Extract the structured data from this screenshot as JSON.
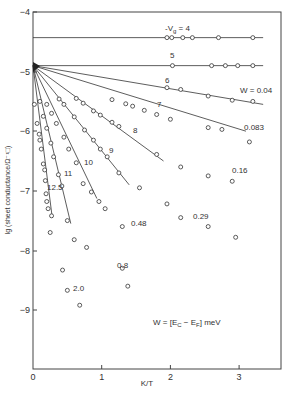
{
  "chart_data": {
    "type": "line",
    "title": "",
    "xlabel": "K/T",
    "ylabel": "lg (sheet conductance/Ω⁻¹□)",
    "xlim": [
      0,
      3.6
    ],
    "ylim": [
      -10,
      -4
    ],
    "x_ticks": [
      "0",
      "1",
      "2",
      "3"
    ],
    "y_ticks": [
      "-4",
      "-5",
      "-6",
      "-7",
      "-8",
      "-9"
    ],
    "grid": false,
    "annotation": "W = [E_C − E_F] meV",
    "origin_point": [
      0,
      -4.9
    ],
    "series": [
      {
        "name": "-Vg = 4",
        "label": "-V_g = 4",
        "w_label": "",
        "line": [
          [
            0,
            -4.43
          ],
          [
            3.35,
            -4.43
          ]
        ],
        "points": [
          [
            1.95,
            -4.43
          ],
          [
            2.02,
            -4.43
          ],
          [
            2.18,
            -4.43
          ],
          [
            2.32,
            -4.43
          ],
          [
            2.7,
            -4.43
          ],
          [
            3.2,
            -4.43
          ]
        ]
      },
      {
        "name": "-Vg = 5",
        "label": "5",
        "w_label": "",
        "line": [
          [
            0,
            -4.9
          ],
          [
            3.35,
            -4.9
          ]
        ],
        "points": [
          [
            2.03,
            -4.9
          ],
          [
            2.6,
            -4.9
          ],
          [
            2.8,
            -4.9
          ],
          [
            2.98,
            -4.9
          ],
          [
            3.2,
            -4.9
          ]
        ]
      },
      {
        "name": "-Vg = 6",
        "label": "6",
        "w_label": "W = 0.04",
        "line": [
          [
            0,
            -4.9
          ],
          [
            3.35,
            -5.55
          ]
        ],
        "points": [
          [
            1.95,
            -5.27
          ],
          [
            2.15,
            -5.3
          ],
          [
            2.55,
            -5.41
          ],
          [
            2.9,
            -5.48
          ],
          [
            3.2,
            -5.5
          ]
        ]
      },
      {
        "name": "-Vg = 7",
        "label": "7",
        "w_label": "0.083",
        "line": [
          [
            0,
            -4.9
          ],
          [
            3.1,
            -6.0
          ]
        ],
        "points": [
          [
            1.15,
            -5.47
          ],
          [
            1.35,
            -5.54
          ],
          [
            1.45,
            -5.58
          ],
          [
            1.62,
            -5.65
          ],
          [
            1.8,
            -5.72
          ],
          [
            2.0,
            -5.8
          ],
          [
            2.55,
            -5.94
          ],
          [
            2.75,
            -5.97
          ]
        ],
        "extra_points": [
          [
            3.15,
            -6.18
          ]
        ]
      },
      {
        "name": "-Vg = 8",
        "label": "8",
        "w_label": "0.16",
        "line": [
          [
            0,
            -4.9
          ],
          [
            1.9,
            -6.5
          ]
        ],
        "points": [
          [
            0.63,
            -5.45
          ],
          [
            0.73,
            -5.53
          ],
          [
            0.88,
            -5.66
          ],
          [
            0.98,
            -5.73
          ],
          [
            1.15,
            -5.85
          ],
          [
            1.25,
            -5.92
          ],
          [
            1.8,
            -6.39
          ]
        ],
        "extra_points": [
          [
            2.15,
            -6.6
          ],
          [
            2.55,
            -6.75
          ],
          [
            2.9,
            -6.84
          ]
        ]
      },
      {
        "name": "-Vg = 9",
        "label": "9",
        "w_label": "0.29",
        "line": [
          [
            0,
            -4.9
          ],
          [
            1.4,
            -6.9
          ]
        ],
        "points": [
          [
            0.38,
            -5.46
          ],
          [
            0.45,
            -5.55
          ],
          [
            0.6,
            -5.76
          ],
          [
            0.75,
            -5.98
          ],
          [
            0.88,
            -6.15
          ],
          [
            0.98,
            -6.3
          ],
          [
            1.08,
            -6.43
          ],
          [
            1.25,
            -6.7
          ]
        ],
        "extra_points": [
          [
            1.55,
            -6.95
          ],
          [
            1.95,
            -7.22
          ],
          [
            2.15,
            -7.45
          ],
          [
            2.55,
            -7.6
          ],
          [
            2.95,
            -7.78
          ]
        ]
      },
      {
        "name": "-Vg = 10",
        "label": "10",
        "w_label": "0.48",
        "line": [
          [
            0,
            -4.9
          ],
          [
            0.93,
            -7.13
          ]
        ],
        "points": [
          [
            0.2,
            -5.55
          ],
          [
            0.27,
            -5.7
          ],
          [
            0.34,
            -5.87
          ],
          [
            0.45,
            -6.1
          ],
          [
            0.52,
            -6.3
          ],
          [
            0.63,
            -6.53
          ],
          [
            0.73,
            -6.88
          ],
          [
            0.85,
            -7.02
          ]
        ],
        "extra_points": [
          [
            0.96,
            -7.18
          ],
          [
            1.05,
            -7.3
          ],
          [
            1.3,
            -7.6
          ]
        ]
      },
      {
        "name": "-Vg = 11",
        "label": "11",
        "w_label": "0.8",
        "line": [
          [
            0,
            -4.9
          ],
          [
            0.55,
            -7.55
          ]
        ],
        "points": [
          [
            0.1,
            -5.5
          ],
          [
            0.15,
            -5.75
          ],
          [
            0.2,
            -5.95
          ],
          [
            0.26,
            -6.2
          ],
          [
            0.3,
            -6.43
          ],
          [
            0.37,
            -6.73
          ],
          [
            0.42,
            -6.92
          ],
          [
            0.5,
            -7.5
          ]
        ],
        "extra_points": [
          [
            0.6,
            -7.82
          ],
          [
            0.78,
            -7.95
          ],
          [
            1.3,
            -8.3
          ],
          [
            1.38,
            -8.6
          ]
        ]
      },
      {
        "name": "-Vg = 12.5",
        "label": "12.5",
        "w_label": "2.0",
        "line": [
          [
            0,
            -4.9
          ],
          [
            0.28,
            -7.45
          ]
        ],
        "points": [
          [
            0.02,
            -5.55
          ],
          [
            0.06,
            -5.87
          ],
          [
            0.09,
            -6.05
          ],
          [
            0.1,
            -6.15
          ],
          [
            0.12,
            -6.3
          ],
          [
            0.15,
            -6.55
          ],
          [
            0.17,
            -6.65
          ],
          [
            0.18,
            -6.83
          ],
          [
            0.19,
            -7.05
          ],
          [
            0.2,
            -7.18
          ],
          [
            0.22,
            -7.3
          ],
          [
            0.27,
            -7.42
          ]
        ],
        "extra_points": [
          [
            0.25,
            -7.7
          ],
          [
            0.43,
            -8.33
          ],
          [
            0.5,
            -8.67
          ],
          [
            0.68,
            -8.92
          ]
        ]
      }
    ]
  },
  "labels": {
    "vg4": "-V",
    "vg4_sub": "g",
    "vg4_eq": " = 4",
    "vg5": "5",
    "vg6": "6",
    "vg7": "7",
    "vg8": "8",
    "vg9": "9",
    "vg10": "10",
    "vg11": "11",
    "vg125": "12.5",
    "w004": "W = 0.04",
    "w0083": "0.083",
    "w016": "0.16",
    "w029": "0.29",
    "w048": "0.48",
    "w08": "0.8",
    "w20": "2.0",
    "annotation": "W = [E",
    "ann_c": "C",
    "ann_mid": " − E",
    "ann_f": "F",
    "ann_end": "] meV",
    "xlabel": "K/T",
    "ylabel": "lg (sheet conductance/Ω⁻¹□)",
    "x0": "0",
    "x1": "1",
    "x2": "2",
    "x3": "3",
    "y4": "−4",
    "y5": "−5",
    "y6": "−6",
    "y7": "−7",
    "y8": "−8",
    "y9": "−9"
  }
}
